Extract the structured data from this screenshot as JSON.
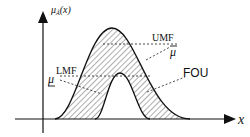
{
  "diagram": {
    "y_axis_label": "μ_Ã(x)",
    "y_axis_label_main": "μ",
    "y_axis_label_sub": "Ã",
    "y_axis_label_arg": "(x)",
    "x_axis_label": "x",
    "labels": {
      "umf": "UMF",
      "umf_symbol": "μ",
      "lmf": "LMF",
      "lmf_symbol": "μ",
      "fou": "FOU"
    },
    "colors": {
      "stroke": "#111111",
      "hatch": "#333333",
      "background": "#ffffff"
    }
  }
}
